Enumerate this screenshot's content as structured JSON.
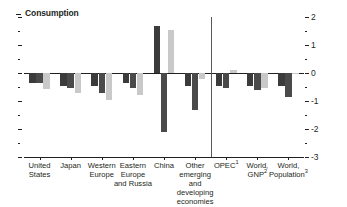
{
  "chart_data": {
    "type": "bar",
    "title": "Consumption",
    "xlabel": "",
    "ylabel": "",
    "ylim": [
      -3,
      2
    ],
    "yticks": [
      2,
      1,
      0,
      -1,
      -2,
      -3
    ],
    "ytick_labels": [
      "2",
      "1",
      "0",
      "-1",
      "-2",
      "-3"
    ],
    "minor_ticks": [
      1.5,
      0.5,
      -0.5,
      -1.5,
      -2.5
    ],
    "grid": false,
    "legend": "none",
    "legend_position": "none",
    "zero_line": 0,
    "categories": [
      "United\nStates",
      "Japan",
      "Western\nEurope",
      "Eastern\nEurope\nand Russia",
      "China",
      "Other\nemerging and\ndeveloping\neconomies",
      "OPEC",
      "World,\nGNP",
      "World,\nPopulation"
    ],
    "category_superscripts": [
      "",
      "",
      "",
      "",
      "",
      "",
      "1",
      "2",
      "3"
    ],
    "series": [
      {
        "name": "series-1",
        "color": "#3b3b3b",
        "values": [
          -0.35,
          -0.45,
          -0.45,
          -0.35,
          1.68,
          -0.45,
          -0.45,
          -0.45,
          -0.45
        ]
      },
      {
        "name": "series-2",
        "color": "#4a4a4a",
        "values": [
          -0.35,
          -0.52,
          -0.72,
          -0.52,
          -2.12,
          -1.32,
          -0.52,
          -0.62,
          -0.85
        ]
      },
      {
        "name": "series-3",
        "color": "#c9c9c9",
        "values": [
          -0.58,
          -0.7,
          -0.95,
          -0.78,
          1.52,
          -0.2,
          0.12,
          -0.55,
          -0.04
        ]
      }
    ]
  },
  "axis": {
    "title_dash": "-",
    "separator_after_category_index": 6
  }
}
